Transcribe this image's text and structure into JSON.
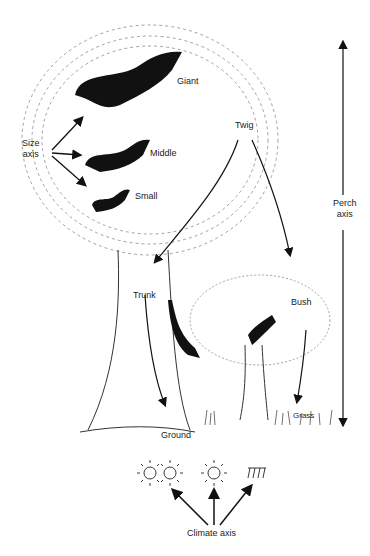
{
  "diagram": {
    "size_axis": {
      "label_line1": "Size",
      "label_line2": "axis",
      "classes": [
        "Giant",
        "Middle",
        "Small"
      ]
    },
    "perch_axis": {
      "label_line1": "Perch",
      "label_line2": "axis",
      "perches": [
        "Twig",
        "Trunk",
        "Bush",
        "Grass",
        "Ground"
      ]
    },
    "climate_axis": {
      "label": "Climate axis",
      "icons": [
        "double-sun-icon",
        "sun-icon",
        "shade-icon"
      ]
    },
    "colors": {
      "ink": "#111111",
      "foliage": "#8a8a8a",
      "background": "#ffffff"
    }
  }
}
